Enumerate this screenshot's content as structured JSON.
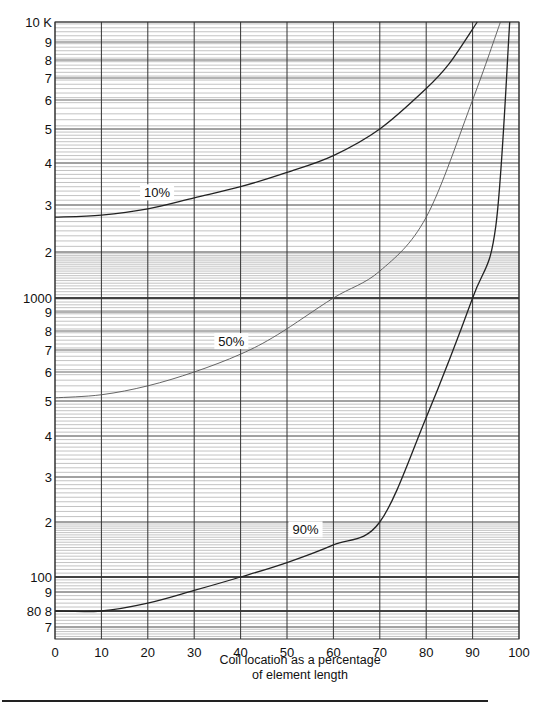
{
  "chart_data": {
    "type": "line",
    "title": "",
    "xlabel": "Coil location as a percentage of element length",
    "xlabel_lines": [
      "Coil location as a percentage",
      "of element length"
    ],
    "ylabel": "",
    "yscale": "log",
    "xlim": [
      0,
      100
    ],
    "ylim": [
      60,
      10000
    ],
    "grid": true,
    "x_ticks": [
      0,
      10,
      20,
      30,
      40,
      50,
      60,
      70,
      80,
      90,
      100
    ],
    "x_tick_labels": [
      "0",
      "10",
      "20",
      "30",
      "40",
      "50",
      "60",
      "70",
      "80",
      "90",
      "100"
    ],
    "y_tick_labels": [
      {
        "label": "10 K",
        "value": 10000
      },
      {
        "label": "9",
        "value": 9000
      },
      {
        "label": "8",
        "value": 8000
      },
      {
        "label": "7",
        "value": 7000
      },
      {
        "label": "6",
        "value": 6000
      },
      {
        "label": "5",
        "value": 5000
      },
      {
        "label": "4",
        "value": 4000
      },
      {
        "label": "3",
        "value": 3000
      },
      {
        "label": "2",
        "value": 2000
      },
      {
        "label": "1000",
        "value": 1000
      },
      {
        "label": "9",
        "value": 900
      },
      {
        "label": "8",
        "value": 800
      },
      {
        "label": "7",
        "value": 700
      },
      {
        "label": "6",
        "value": 600
      },
      {
        "label": "5",
        "value": 500
      },
      {
        "label": "4",
        "value": 400
      },
      {
        "label": "3",
        "value": 300
      },
      {
        "label": "2",
        "value": 200
      },
      {
        "label": "100",
        "value": 100
      },
      {
        "label": "9",
        "value": 90
      },
      {
        "label": "80 8",
        "value": 80
      },
      {
        "label": "7",
        "value": 70
      }
    ],
    "series": [
      {
        "name": "10%",
        "label_pos": {
          "x": 22,
          "value": 3250
        },
        "x": [
          0,
          10,
          20,
          30,
          40,
          50,
          60,
          70,
          80,
          85,
          91
        ],
        "values": [
          2700,
          2750,
          2900,
          3150,
          3400,
          3750,
          4200,
          5000,
          6500,
          7800,
          10000
        ]
      },
      {
        "name": "50%",
        "label_pos": {
          "x": 38,
          "value": 740
        },
        "x": [
          0,
          10,
          20,
          30,
          40,
          48,
          60,
          70,
          80,
          90,
          96
        ],
        "values": [
          510,
          520,
          550,
          600,
          680,
          780,
          1000,
          1500,
          2700,
          6000,
          10000
        ]
      },
      {
        "name": "90%",
        "label_pos": {
          "x": 54,
          "value": 180
        },
        "x": [
          0,
          10,
          20,
          30,
          40,
          50,
          60,
          70,
          80,
          90,
          95,
          98
        ],
        "values": [
          80,
          80,
          84,
          91,
          100,
          120,
          150,
          200,
          450,
          1000,
          2500,
          10000
        ]
      }
    ]
  },
  "axis": {
    "x_label_line1": "Coil location as a percentage",
    "x_label_line2": "of element length"
  }
}
